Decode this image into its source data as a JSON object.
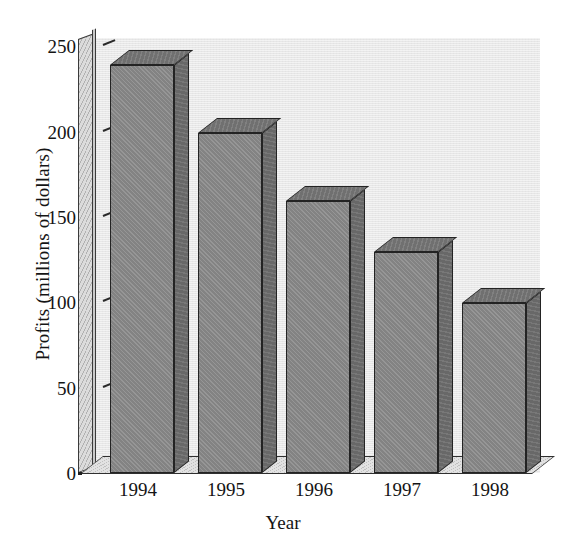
{
  "chart_data": {
    "type": "bar",
    "title": "",
    "subtitle": "",
    "xlabel": "Year",
    "ylabel": "Profits (millions of dollars)",
    "categories": [
      "1994",
      "1995",
      "1996",
      "1997",
      "1998"
    ],
    "values": [
      240,
      200,
      160,
      130,
      100
    ],
    "series": [
      {
        "name": "Profits",
        "values": [
          240,
          200,
          160,
          130,
          100
        ]
      }
    ],
    "ylim": [
      0,
      250
    ],
    "yticks": [
      0,
      50,
      100,
      150,
      200,
      250
    ],
    "ytick_labels": [
      "0",
      "50",
      "100",
      "150",
      "200",
      "250"
    ],
    "xtick_labels": [
      "1994",
      "1995",
      "1996",
      "1997",
      "1998"
    ],
    "grid": false,
    "legend": null,
    "legend_position": "none",
    "style": "3d-bar",
    "annotations": []
  },
  "axes": {
    "y_title": "Profits (millions of dollars)",
    "x_title": "Year",
    "y_ticks": [
      {
        "label": "250",
        "value": 250
      },
      {
        "label": "200",
        "value": 200
      },
      {
        "label": "150",
        "value": 150
      },
      {
        "label": "100",
        "value": 100
      },
      {
        "label": "50",
        "value": 50
      },
      {
        "label": "0",
        "value": 0
      }
    ],
    "x_ticks": [
      {
        "label": "1994"
      },
      {
        "label": "1995"
      },
      {
        "label": "1996"
      },
      {
        "label": "1997"
      },
      {
        "label": "1998"
      }
    ]
  },
  "colors": {
    "plot_background": "#e7e7e7",
    "page_background": "#ffffff",
    "bar_front": "#8a8a8a",
    "bar_side": "#6e6e6e",
    "bar_top": "#767676",
    "bar_outline": "#232323",
    "axis_wall": "#dcdcdc",
    "floor": "#e2e2e2",
    "text": "#141414"
  }
}
